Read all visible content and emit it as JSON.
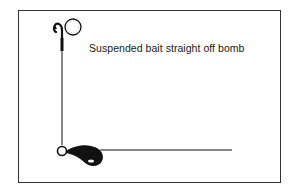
{
  "diagram": {
    "caption": "Suspended bait straight off bomb",
    "components": [
      {
        "name": "hook",
        "icon": "hook-icon"
      },
      {
        "name": "bait",
        "icon": "boilie-icon"
      },
      {
        "name": "hooklink",
        "icon": "line"
      },
      {
        "name": "swivel",
        "icon": "swivel-ring-icon"
      },
      {
        "name": "bomb-lead",
        "icon": "bomb-weight-icon"
      },
      {
        "name": "mainline",
        "icon": "line"
      }
    ],
    "colors": {
      "ink": "#111111",
      "frame": "#333333",
      "background": "#ffffff"
    }
  }
}
